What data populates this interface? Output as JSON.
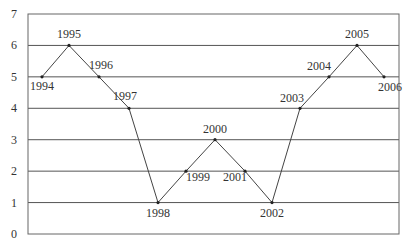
{
  "chart_data": {
    "type": "line",
    "title": "",
    "xlabel": "",
    "ylabel": "",
    "categories": [
      "1994",
      "1995",
      "1996",
      "1997",
      "1998",
      "1999",
      "2000",
      "2001",
      "2002",
      "2003",
      "2004",
      "2005",
      "2006"
    ],
    "values": [
      5,
      6,
      5,
      4,
      1,
      2,
      3,
      2,
      1,
      4,
      5,
      6,
      5
    ],
    "ylim": [
      0,
      7
    ],
    "yticks": [
      "0",
      "1",
      "2",
      "3",
      "4",
      "5",
      "6",
      "7"
    ],
    "grid": true,
    "legend": null,
    "point_labels": true,
    "colors": {
      "line": "#444444",
      "grid": "#555555",
      "marker": "#222222"
    }
  }
}
